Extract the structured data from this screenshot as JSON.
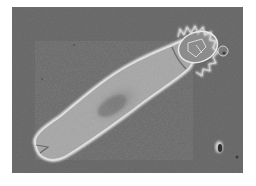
{
  "image": {
    "description": "Phase-contrast micrograph of a rotifer on a gray background",
    "subject": "rotifer",
    "features": [
      "ciliated corona",
      "elongated body",
      "forked foot",
      "debris particle"
    ],
    "colors": {
      "border": "#ffffff",
      "background": "#6f6f6f",
      "body_halo": "#e8e8e8",
      "body_fill": "#a4a4a4",
      "body_core": "#7a7a7a"
    }
  }
}
